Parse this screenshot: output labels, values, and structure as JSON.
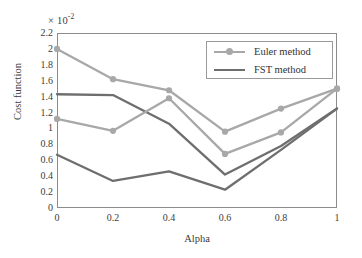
{
  "chart_data": {
    "type": "line",
    "title": "",
    "xlabel": "Alpha",
    "ylabel": "Cost function",
    "y_multiplier": "× 10",
    "y_multiplier_exponent": "-2",
    "x": [
      0,
      0.2,
      0.4,
      0.6,
      0.8,
      1
    ],
    "categories": [
      "0",
      "0.2",
      "0.4",
      "0.6",
      "0.8",
      "1"
    ],
    "xlim": [
      0,
      1
    ],
    "ylim": [
      0,
      2.2
    ],
    "ytick_labels": [
      "2.2",
      "2",
      "1.8",
      "1.6",
      "1.4",
      "1.2",
      "1",
      "0.8",
      "0.6",
      "0.4",
      "0.2",
      "0"
    ],
    "ytick_values": [
      2.2,
      2,
      1.8,
      1.6,
      1.4,
      1.2,
      1,
      0.8,
      0.6,
      0.4,
      0.2,
      0
    ],
    "grid": false,
    "legend_position": "upper right",
    "series": [
      {
        "name": "Euler method",
        "legend_key": "Euler method",
        "color": "#a8a8a8",
        "marker": "circle",
        "values": [
          2.0,
          1.62,
          1.48,
          0.96,
          1.25,
          1.5
        ]
      },
      {
        "name": "FST method",
        "legend_key": "FST method",
        "color": "#6e6e6e",
        "marker": "none",
        "values": [
          1.43,
          1.42,
          1.06,
          0.42,
          0.78,
          1.25
        ]
      },
      {
        "name": "Euler method",
        "legend_key": "Euler method",
        "color": "#a8a8a8",
        "marker": "circle",
        "values": [
          1.12,
          0.97,
          1.38,
          0.68,
          0.95,
          1.5
        ]
      },
      {
        "name": "FST method",
        "legend_key": "FST method",
        "color": "#6e6e6e",
        "marker": "none",
        "values": [
          0.67,
          0.34,
          0.46,
          0.23,
          0.73,
          1.25
        ]
      }
    ],
    "legend_entries": [
      {
        "label": "Euler method",
        "color": "#a8a8a8",
        "marker": "circle"
      },
      {
        "label": "FST method",
        "color": "#6e6e6e",
        "marker": "none"
      }
    ]
  }
}
